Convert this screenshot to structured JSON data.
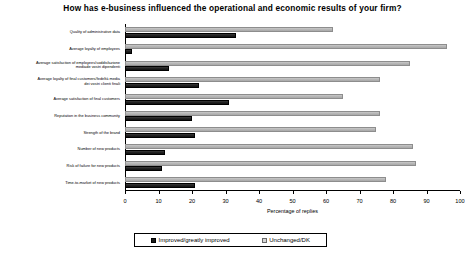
{
  "chart_data": {
    "type": "bar",
    "orientation": "horizontal",
    "title": "How has e-business influenced the operational and economic results of your firm?",
    "xlabel": "Percentage of replies",
    "ylabel": "",
    "xlim": [
      0,
      100
    ],
    "xticks": [
      0,
      10,
      20,
      30,
      40,
      50,
      60,
      70,
      80,
      90,
      100
    ],
    "grid": false,
    "legend_position": "bottom",
    "categories": [
      "Quality of administrative data",
      "Average loyalty of employees",
      "Average satisfaction of employees/soddisfazione mediade vostri dipendenti",
      "Average loyalty of final customers/fedeltà media dei vostri clienti finali",
      "Average satisfaction of final customers",
      "Reputation in the business community",
      "Strength of the brand",
      "Number of new products",
      "Risk of failure for new products",
      "Time-to-market of new products"
    ],
    "category_lines": [
      [
        "Quality of administrative data"
      ],
      [
        "Average loyalty of employees"
      ],
      [
        "Average satisfaction of employees/soddisfazione",
        "mediade vostri dipendenti"
      ],
      [
        "Average loyalty of final customers/fedeltà media",
        "dei vostri clienti finali"
      ],
      [
        "Average satisfaction of final customers"
      ],
      [
        "Reputation in the business community"
      ],
      [
        "Strength of the brand"
      ],
      [
        "Number of new products"
      ],
      [
        "Risk of failure for new products"
      ],
      [
        "Time-to-market of new products"
      ]
    ],
    "series": [
      {
        "name": "Improved/greatly improved",
        "color": "#1a1a1a",
        "values": [
          33,
          2,
          13,
          22,
          31,
          20,
          21,
          12,
          11,
          21
        ]
      },
      {
        "name": "Unchanged/DK",
        "color": "#c0c0c0",
        "values": [
          62,
          96,
          85,
          76,
          65,
          76,
          75,
          86,
          87,
          78
        ]
      }
    ]
  },
  "legend": {
    "items": [
      {
        "label": "Improved/greatly improved",
        "swatch": "dark-square-icon"
      },
      {
        "label": "Unchanged/DK",
        "swatch": "light-square-icon"
      }
    ]
  }
}
